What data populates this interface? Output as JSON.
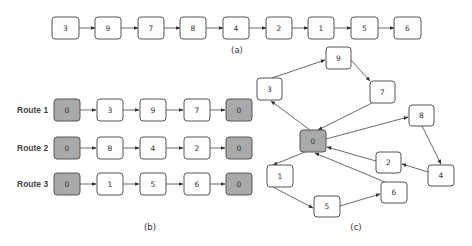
{
  "panel_a": {
    "caption": "(a)",
    "sequence": [
      "3",
      "9",
      "7",
      "8",
      "4",
      "2",
      "1",
      "5",
      "6"
    ]
  },
  "panel_b": {
    "caption": "(b)",
    "routes": [
      {
        "label": "Route 1",
        "nodes": [
          "0",
          "3",
          "9",
          "7",
          "0"
        ]
      },
      {
        "label": "Route 2",
        "nodes": [
          "0",
          "8",
          "4",
          "2",
          "0"
        ]
      },
      {
        "label": "Route 3",
        "nodes": [
          "0",
          "1",
          "5",
          "6",
          "0"
        ]
      }
    ]
  },
  "panel_c": {
    "caption": "(c)",
    "nodes": {
      "n0": "0",
      "n1": "1",
      "n2": "2",
      "n3": "3",
      "n4": "4",
      "n5": "5",
      "n6": "6",
      "n7": "7",
      "n8": "8",
      "n9": "9"
    },
    "edges": [
      [
        "0",
        "3"
      ],
      [
        "3",
        "9"
      ],
      [
        "9",
        "7"
      ],
      [
        "7",
        "0"
      ],
      [
        "0",
        "8"
      ],
      [
        "8",
        "4"
      ],
      [
        "4",
        "2"
      ],
      [
        "2",
        "0"
      ],
      [
        "0",
        "1"
      ],
      [
        "1",
        "5"
      ],
      [
        "5",
        "6"
      ],
      [
        "6",
        "0"
      ]
    ]
  },
  "colors": {
    "depot_fill": "#a9a9a9",
    "node_fill": "#ffffff",
    "stroke": "#555555"
  }
}
